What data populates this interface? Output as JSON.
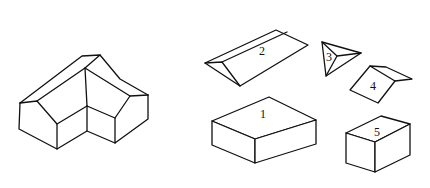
{
  "figure": {
    "composite": {
      "name": "L-shaped house"
    },
    "parts": [
      {
        "id": "1",
        "label": "1",
        "shape": "rectangular block (long)"
      },
      {
        "id": "2",
        "label": "2",
        "shape": "triangular prism (roof)"
      },
      {
        "id": "3",
        "label": "3",
        "shape": "triangular pyramid (roof junction)"
      },
      {
        "id": "4",
        "label": "4",
        "shape": "wedge / truncated prism (roof)"
      },
      {
        "id": "5",
        "label": "5",
        "shape": "rectangular block (short)"
      }
    ],
    "colors": {
      "stroke": "#111111",
      "background": "#ffffff"
    }
  }
}
